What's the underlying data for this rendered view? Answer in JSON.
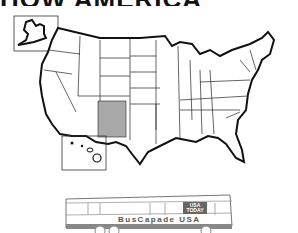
{
  "header": {
    "title_partial": "HOW AMERICA"
  },
  "map": {
    "highlighted_state": "New Mexico",
    "highlight_color": "#a9a9a9",
    "insets": [
      "Alaska",
      "Hawaii"
    ]
  },
  "bus": {
    "name": "BusCapade USA",
    "logo_line1": "USA",
    "logo_line2": "TODAY"
  }
}
